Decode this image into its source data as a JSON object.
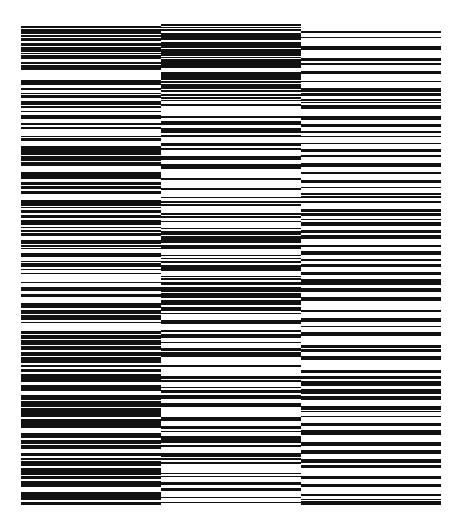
{
  "artwork": {
    "title": "Horizontal stripe composition in three columns",
    "background": "#ffffff",
    "ink": "#111111",
    "columns": [
      {
        "name": "left",
        "x": 21,
        "top": 26,
        "bottom": 506,
        "width": 140,
        "seed": 11,
        "density_profile": [
          [
            26,
            0.62
          ],
          [
            80,
            0.58
          ],
          [
            120,
            0.6
          ],
          [
            170,
            0.72
          ],
          [
            210,
            0.75
          ],
          [
            240,
            0.55
          ],
          [
            300,
            0.6
          ],
          [
            340,
            0.65
          ],
          [
            380,
            0.7
          ],
          [
            420,
            0.62
          ],
          [
            460,
            0.72
          ],
          [
            506,
            0.75
          ]
        ]
      },
      {
        "name": "middle",
        "x": 161,
        "top": 24,
        "bottom": 506,
        "width": 140,
        "seed": 37,
        "density_profile": [
          [
            24,
            0.68
          ],
          [
            80,
            0.66
          ],
          [
            120,
            0.45
          ],
          [
            170,
            0.55
          ],
          [
            220,
            0.6
          ],
          [
            240,
            0.72
          ],
          [
            290,
            0.78
          ],
          [
            310,
            0.7
          ],
          [
            320,
            0.25
          ],
          [
            380,
            0.35
          ],
          [
            420,
            0.5
          ],
          [
            460,
            0.45
          ],
          [
            506,
            0.5
          ]
        ]
      },
      {
        "name": "right",
        "x": 301,
        "top": 31,
        "bottom": 506,
        "width": 140,
        "seed": 73,
        "density_profile": [
          [
            31,
            0.25
          ],
          [
            80,
            0.3
          ],
          [
            120,
            0.32
          ],
          [
            170,
            0.35
          ],
          [
            210,
            0.45
          ],
          [
            240,
            0.4
          ],
          [
            300,
            0.45
          ],
          [
            340,
            0.5
          ],
          [
            380,
            0.6
          ],
          [
            410,
            0.62
          ],
          [
            420,
            0.3
          ],
          [
            460,
            0.45
          ],
          [
            506,
            0.5
          ]
        ]
      }
    ]
  }
}
